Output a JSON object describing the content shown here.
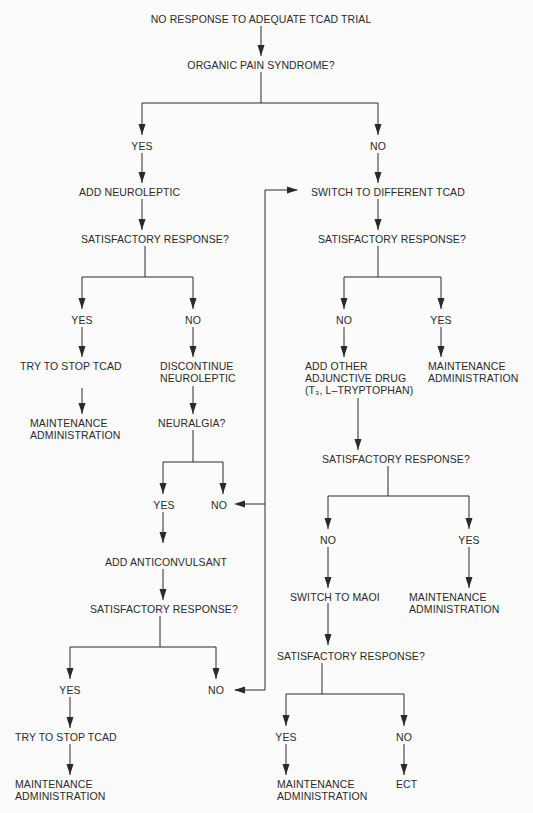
{
  "flowchart": {
    "nodes": {
      "start": "NO RESPONSE TO ADEQUATE TCAD TRIAL",
      "q_organic": "ORGANIC PAIN SYNDROME?",
      "yes_organic": "YES",
      "no_organic": "NO",
      "add_neuroleptic": "ADD NEUROLEPTIC",
      "q_sat1": "SATISFACTORY RESPONSE?",
      "yes_sat1": "YES",
      "no_sat1": "NO",
      "try_stop1": "TRY TO STOP TCAD",
      "maint1": "MAINTENANCE\nADMINISTRATION",
      "discontinue": "DISCONTINUE\nNEUROLEPTIC",
      "q_neuralgia": "NEURALGIA?",
      "yes_neuralgia": "YES",
      "no_neuralgia": "NO",
      "add_anticonvulsant": "ADD ANTICONVULSANT",
      "q_sat2": "SATISFACTORY RESPONSE?",
      "yes_sat2": "YES",
      "no_sat2": "NO",
      "try_stop2": "TRY TO STOP TCAD",
      "maint2": "MAINTENANCE\nADMINISTRATION",
      "switch_tcad": "SWITCH TO DIFFERENT TCAD",
      "q_sat3": "SATISFACTORY RESPONSE?",
      "no_sat3": "NO",
      "yes_sat3": "YES",
      "add_adjunctive": "ADD OTHER\nADJUNCTIVE DRUG\n(T₃, L–TRYPTOPHAN)",
      "maint3": "MAINTENANCE\nADMINISTRATION",
      "q_sat4": "SATISFACTORY RESPONSE?",
      "no_sat4": "NO",
      "yes_sat4": "YES",
      "switch_maoi": "SWITCH TO MAOI",
      "maint4": "MAINTENANCE\nADMINISTRATION",
      "q_sat5": "SATISFACTORY RESPONSE?",
      "yes_sat5": "YES",
      "no_sat5": "NO",
      "maint5": "MAINTENANCE\nADMINISTRATION",
      "ect": "ECT"
    },
    "edges": [
      [
        "start",
        "q_organic"
      ],
      [
        "q_organic",
        "yes_organic"
      ],
      [
        "q_organic",
        "no_organic"
      ],
      [
        "yes_organic",
        "add_neuroleptic"
      ],
      [
        "add_neuroleptic",
        "q_sat1"
      ],
      [
        "q_sat1",
        "yes_sat1"
      ],
      [
        "q_sat1",
        "no_sat1"
      ],
      [
        "yes_sat1",
        "try_stop1"
      ],
      [
        "try_stop1",
        "maint1"
      ],
      [
        "no_sat1",
        "discontinue"
      ],
      [
        "discontinue",
        "q_neuralgia"
      ],
      [
        "q_neuralgia",
        "yes_neuralgia"
      ],
      [
        "q_neuralgia",
        "no_neuralgia"
      ],
      [
        "yes_neuralgia",
        "add_anticonvulsant"
      ],
      [
        "add_anticonvulsant",
        "q_sat2"
      ],
      [
        "q_sat2",
        "yes_sat2"
      ],
      [
        "q_sat2",
        "no_sat2"
      ],
      [
        "yes_sat2",
        "try_stop2"
      ],
      [
        "try_stop2",
        "maint2"
      ],
      [
        "no_organic",
        "switch_tcad"
      ],
      [
        "no_neuralgia",
        "switch_tcad"
      ],
      [
        "no_sat2",
        "switch_tcad"
      ],
      [
        "switch_tcad",
        "q_sat3"
      ],
      [
        "q_sat3",
        "no_sat3"
      ],
      [
        "q_sat3",
        "yes_sat3"
      ],
      [
        "no_sat3",
        "add_adjunctive"
      ],
      [
        "yes_sat3",
        "maint3"
      ],
      [
        "add_adjunctive",
        "q_sat4"
      ],
      [
        "q_sat4",
        "no_sat4"
      ],
      [
        "q_sat4",
        "yes_sat4"
      ],
      [
        "no_sat4",
        "switch_maoi"
      ],
      [
        "yes_sat4",
        "maint4"
      ],
      [
        "switch_maoi",
        "q_sat5"
      ],
      [
        "q_sat5",
        "yes_sat5"
      ],
      [
        "q_sat5",
        "no_sat5"
      ],
      [
        "yes_sat5",
        "maint5"
      ],
      [
        "no_sat5",
        "ect"
      ]
    ]
  },
  "colors": {
    "ink": "#2a2a2a",
    "paper": "#fbfbfb"
  }
}
